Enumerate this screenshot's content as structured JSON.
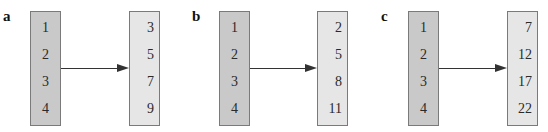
{
  "panels": [
    {
      "label": "a",
      "domain": [
        "1",
        "2",
        "3",
        "4"
      ],
      "range": [
        "3",
        "5",
        "7",
        "9"
      ]
    },
    {
      "label": "b",
      "domain": [
        "1",
        "2",
        "3",
        "4"
      ],
      "range": [
        "2",
        "5",
        "8",
        "11"
      ]
    },
    {
      "label": "c",
      "domain": [
        "1",
        "2",
        "3",
        "4"
      ],
      "range": [
        "7",
        "12",
        "17",
        "22"
      ]
    }
  ],
  "colors": {
    "domain_fill": "#c9c9c9",
    "range_fill": "#e6e6e6",
    "border": "#7a7a7a",
    "arrow": "#333333"
  }
}
